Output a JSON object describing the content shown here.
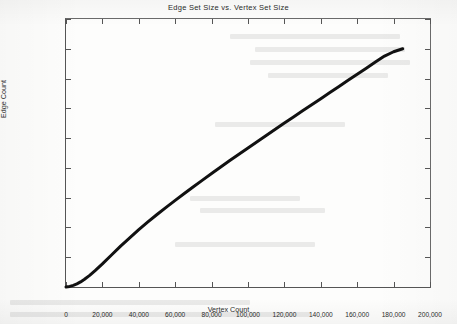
{
  "chart_data": {
    "type": "line",
    "title": "Edge Set Size vs. Vertex Set Size",
    "xlabel": "Vertex Count",
    "ylabel": "Edge Count",
    "xlim": [
      0,
      200000
    ],
    "ylim": [
      0,
      1800000
    ],
    "grid": false,
    "legend": null,
    "xticks": [
      0,
      20000,
      40000,
      60000,
      80000,
      100000,
      120000,
      140000,
      160000,
      180000,
      200000
    ],
    "xtick_labels": [
      "0",
      "20,000",
      "40,000",
      "60,000",
      "80,000",
      "100,000",
      "120,000",
      "140,000",
      "160,000",
      "180,000",
      "200,000"
    ],
    "yticks": [
      0,
      200000,
      400000,
      600000,
      800000,
      1000000,
      1200000,
      1400000,
      1600000,
      1800000
    ],
    "ytick_labels": [
      "0",
      "200,000",
      "400,000",
      "600,000",
      "800,000",
      "1e+06",
      "1.2e+06",
      "1.4e+06",
      "1.6e+06",
      "1.8e+06"
    ],
    "series": [
      {
        "name": "Edge Count",
        "color": "#111111",
        "line_width": 3.0,
        "x": [
          0,
          2000,
          4000,
          6000,
          8000,
          10000,
          13000,
          16000,
          20000,
          25000,
          30000,
          35000,
          40000,
          45000,
          50000,
          55000,
          60000,
          65000,
          70000,
          75000,
          80000,
          85000,
          90000,
          95000,
          100000,
          105000,
          110000,
          115000,
          120000,
          125000,
          130000,
          135000,
          140000,
          145000,
          150000,
          155000,
          160000,
          165000,
          170000,
          175000,
          180000,
          185000
        ],
        "y": [
          0,
          4000,
          11000,
          21000,
          34000,
          50000,
          78000,
          110000,
          155000,
          215000,
          275000,
          330000,
          385000,
          437000,
          487000,
          535000,
          582000,
          628000,
          673000,
          718000,
          762000,
          806000,
          849000,
          892000,
          934000,
          976000,
          1018000,
          1060000,
          1101000,
          1142000,
          1183000,
          1224000,
          1265000,
          1306000,
          1347000,
          1388000,
          1429000,
          1470000,
          1511000,
          1551000,
          1580000,
          1600000
        ]
      }
    ]
  }
}
